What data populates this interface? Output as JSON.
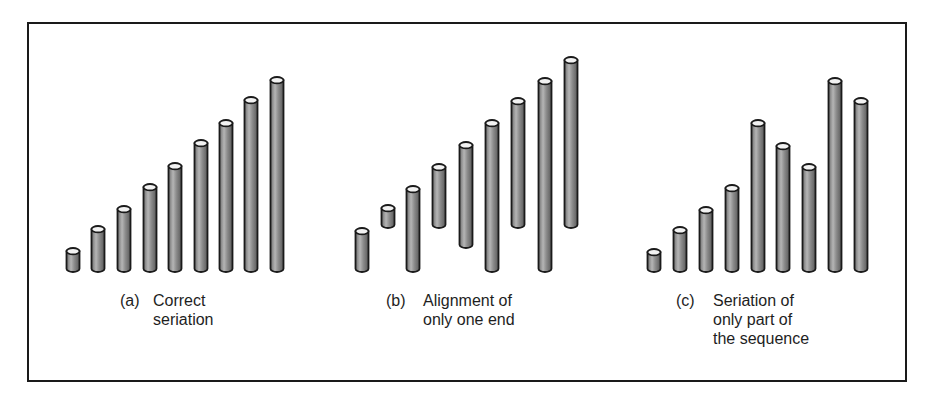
{
  "figure": {
    "panels": [
      {
        "id": "a",
        "tag": "(a)",
        "caption_lines": [
          "Correct",
          "seriation"
        ],
        "rods": [
          {
            "x": 73,
            "top": 248,
            "bottom": 272
          },
          {
            "x": 98,
            "top": 226,
            "bottom": 272
          },
          {
            "x": 124,
            "top": 206,
            "bottom": 272
          },
          {
            "x": 150,
            "top": 184,
            "bottom": 272
          },
          {
            "x": 175,
            "top": 163,
            "bottom": 272
          },
          {
            "x": 201,
            "top": 140,
            "bottom": 272
          },
          {
            "x": 226,
            "top": 120,
            "bottom": 272
          },
          {
            "x": 251,
            "top": 97,
            "bottom": 272
          },
          {
            "x": 277,
            "top": 77,
            "bottom": 272
          }
        ]
      },
      {
        "id": "b",
        "tag": "(b)",
        "caption_lines": [
          "Alignment of",
          "only one end"
        ],
        "rods": [
          {
            "x": 362,
            "top": 228,
            "bottom": 272
          },
          {
            "x": 388,
            "top": 205,
            "bottom": 228
          },
          {
            "x": 413,
            "top": 186,
            "bottom": 272
          },
          {
            "x": 439,
            "top": 164,
            "bottom": 228
          },
          {
            "x": 466,
            "top": 142,
            "bottom": 248
          },
          {
            "x": 492,
            "top": 120,
            "bottom": 272
          },
          {
            "x": 518,
            "top": 98,
            "bottom": 228
          },
          {
            "x": 545,
            "top": 78,
            "bottom": 272
          },
          {
            "x": 571,
            "top": 57,
            "bottom": 228
          }
        ]
      },
      {
        "id": "c",
        "tag": "(c)",
        "caption_lines": [
          "Seriation of",
          "only part of",
          "the sequence"
        ],
        "rods": [
          {
            "x": 654,
            "top": 249,
            "bottom": 272
          },
          {
            "x": 680,
            "top": 227,
            "bottom": 272
          },
          {
            "x": 706,
            "top": 207,
            "bottom": 272
          },
          {
            "x": 732,
            "top": 185,
            "bottom": 272
          },
          {
            "x": 758,
            "top": 120,
            "bottom": 272
          },
          {
            "x": 783,
            "top": 143,
            "bottom": 272
          },
          {
            "x": 809,
            "top": 164,
            "bottom": 272
          },
          {
            "x": 835,
            "top": 78,
            "bottom": 272
          },
          {
            "x": 861,
            "top": 98,
            "bottom": 272
          }
        ]
      }
    ],
    "colors": {
      "rod_fill": "#8a8a8a",
      "rod_highlight": "#c8c8c8",
      "rod_outline": "#1a1a1a",
      "rod_cap": "#f2f2f2",
      "frame": "#1a1a1a",
      "text": "#1e1e1e"
    }
  }
}
